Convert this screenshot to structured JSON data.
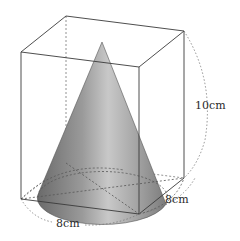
{
  "figure": {
    "labels": {
      "height": "10cm",
      "base_width": "8cm",
      "base_depth": "8cm"
    },
    "colors": {
      "edge": "#3a3a3a",
      "hidden_edge": "#666666",
      "cone_dark": "#6e6e6e",
      "cone_light": "#c4c4c4",
      "background": "#ffffff"
    }
  }
}
